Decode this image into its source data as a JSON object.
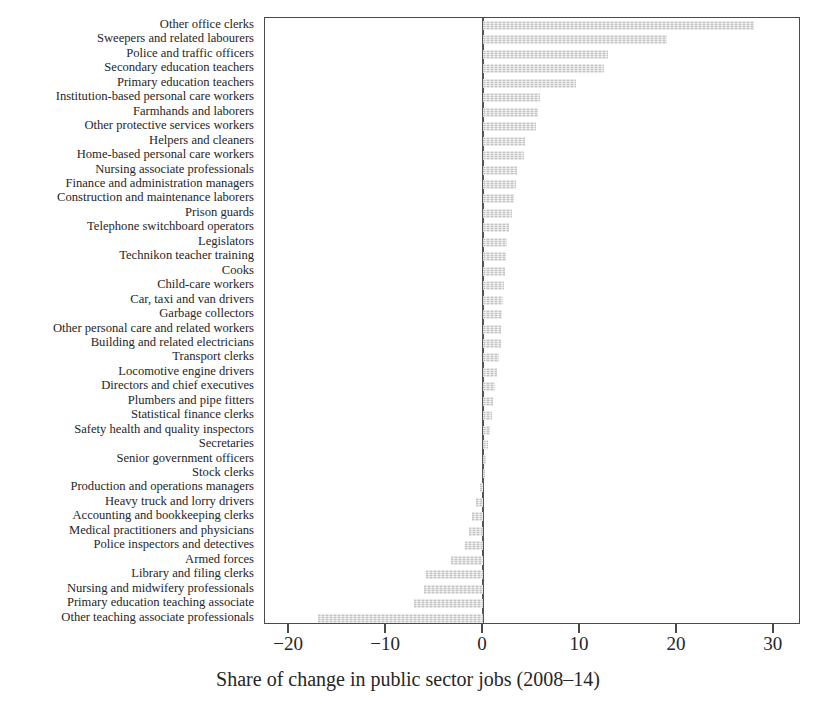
{
  "chart_data": {
    "type": "bar",
    "orientation": "horizontal",
    "title": "",
    "xlabel": "Share of change in public sector jobs (2008–14)",
    "ylabel": "",
    "xlim": [
      -22.5,
      32.8
    ],
    "xticks": [
      -20,
      -10,
      0,
      10,
      20,
      30
    ],
    "xticklabels": [
      "−20",
      "−10",
      "0",
      "10",
      "20",
      "30"
    ],
    "grid": false,
    "legend": null,
    "bar_color": "#d2d2d2",
    "zero_line": 0,
    "categories": [
      "Other office clerks",
      "Sweepers and related labourers",
      "Police and traffic officers",
      "Secondary education teachers",
      "Primary education teachers",
      "Institution-based personal care workers",
      "Farmhands and laborers",
      "Other protective services workers",
      "Helpers and cleaners",
      "Home-based personal care workers",
      "Nursing associate professionals",
      "Finance and administration managers",
      "Construction and maintenance laborers",
      "Prison guards",
      "Telephone switchboard operators",
      "Legislators",
      "Technikon teacher training",
      "Cooks",
      "Child-care workers",
      "Car, taxi and van drivers",
      "Garbage collectors",
      "Other personal care and related workers",
      "Building and related electricians",
      "Transport clerks",
      "Locomotive engine drivers",
      "Directors and chief executives",
      "Plumbers and pipe fitters",
      "Statistical finance clerks",
      "Safety health and quality inspectors",
      "Secretaries",
      "Senior government officers",
      "Stock clerks",
      "Production and operations managers",
      "Heavy truck and lorry drivers",
      "Accounting and bookkeeping clerks",
      "Medical practitioners and physicians",
      "Police inspectors and detectives",
      "Armed forces",
      "Library and filing clerks",
      "Nursing and midwifery professionals",
      "Primary education teaching associate",
      "Other teaching associate professionals"
    ],
    "values": [
      28.0,
      19.0,
      12.9,
      12.5,
      9.6,
      5.9,
      5.7,
      5.5,
      4.3,
      4.2,
      3.5,
      3.4,
      3.2,
      3.0,
      2.7,
      2.5,
      2.4,
      2.3,
      2.2,
      2.1,
      2.0,
      1.9,
      1.8,
      1.6,
      1.4,
      1.2,
      1.0,
      0.9,
      0.7,
      0.5,
      0.3,
      0.2,
      -0.3,
      -0.7,
      -1.1,
      -1.5,
      -1.9,
      -3.3,
      -5.9,
      -6.1,
      -7.1,
      -17.0
    ]
  }
}
